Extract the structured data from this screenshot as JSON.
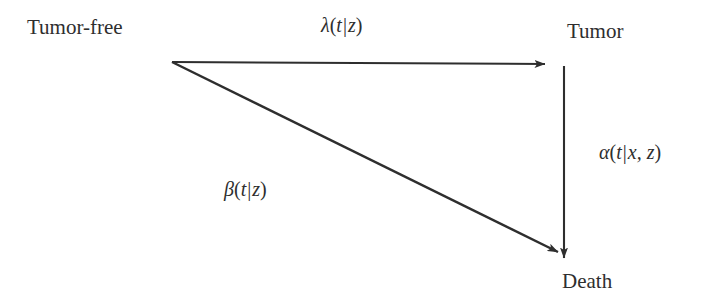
{
  "diagram": {
    "type": "state-transition-diagram",
    "background_color": "#ffffff",
    "stroke_color": "#2e2e2e",
    "nodes": [
      {
        "id": "tumor-free",
        "label": "Tumor-free",
        "x": 27,
        "y": 17
      },
      {
        "id": "tumor",
        "label": "Tumor",
        "x": 567,
        "y": 21
      },
      {
        "id": "death",
        "label": "Death",
        "x": 562,
        "y": 271
      }
    ],
    "edges": [
      {
        "id": "tumor-free-to-tumor",
        "from": "tumor-free",
        "to": "tumor",
        "label": "λ(t|z)",
        "label_parts": {
          "fn": "λ",
          "open": "(",
          "arg": "t",
          "bar": "|",
          "cond": "z",
          "close": ")"
        },
        "x1": 172,
        "y1": 62,
        "x2": 545,
        "y2": 64
      },
      {
        "id": "tumor-free-to-death",
        "from": "tumor-free",
        "to": "death",
        "label": "β(t|z)",
        "label_parts": {
          "fn": "β",
          "open": "(",
          "arg": "t",
          "bar": "|",
          "cond": "z",
          "close": ")"
        },
        "x1": 172,
        "y1": 62,
        "x2": 558,
        "y2": 252
      },
      {
        "id": "tumor-to-death",
        "from": "tumor",
        "to": "death",
        "label": "α(t|x, z)",
        "label_parts": {
          "fn": "α",
          "open": "(",
          "arg": "t",
          "bar": "|",
          "cond": "x, z",
          "close": ")"
        },
        "x1": 564,
        "y1": 66,
        "x2": 564,
        "y2": 258
      }
    ]
  }
}
